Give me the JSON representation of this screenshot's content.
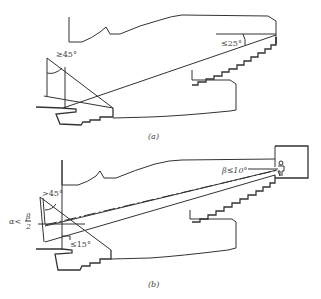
{
  "figure_a": {
    "caption": "(a)",
    "angle_label_left": "≥45°",
    "angle_label_right": "≤25°"
  },
  "figure_b": {
    "caption": "(b)",
    "angle_label_top_left": ">45°",
    "angle_label_alpha_prefix": "α<",
    "angle_label_alpha_num": "β",
    "angle_label_alpha_den": "2",
    "angle_label_bottom": "≤15°",
    "angle_label_beta": "β≤10°"
  }
}
